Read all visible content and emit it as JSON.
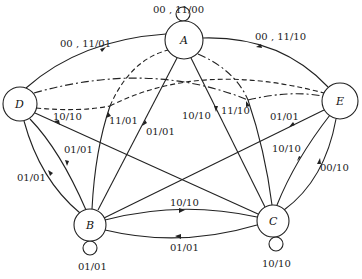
{
  "diagram": {
    "type": "state-transition-graph",
    "nodes": [
      {
        "id": "A",
        "label": "A",
        "x": 184,
        "y": 40,
        "r": 19,
        "self_loop": "00 , 11/00"
      },
      {
        "id": "B",
        "label": "B",
        "x": 90,
        "y": 225,
        "r": 16,
        "self_loop": "01/01"
      },
      {
        "id": "C",
        "label": "C",
        "x": 273,
        "y": 221,
        "r": 16,
        "self_loop": "10/10"
      },
      {
        "id": "D",
        "label": "D",
        "x": 20,
        "y": 104,
        "r": 17
      },
      {
        "id": "E",
        "label": "E",
        "x": 340,
        "y": 101,
        "r": 18
      }
    ],
    "edge_labels": {
      "d_to_a": "00 , 11/01",
      "e_to_a": "00 , 11/10",
      "a_self": "00 , 11/00",
      "d_to_c": "10/10",
      "b_to_a_dashed": "11/01",
      "a_to_b": "01/01",
      "a_to_c": "10/10",
      "c_to_a_dashdot": "11/10",
      "e_to_b": "01/01",
      "e_to_c": "10/10",
      "c_to_e": "00/10",
      "d_to_b": "01/01",
      "b_to_d": "01/01",
      "b_to_c": "10/10",
      "c_to_b": "01/01",
      "b_self": "01/01",
      "c_self": "10/10"
    }
  }
}
